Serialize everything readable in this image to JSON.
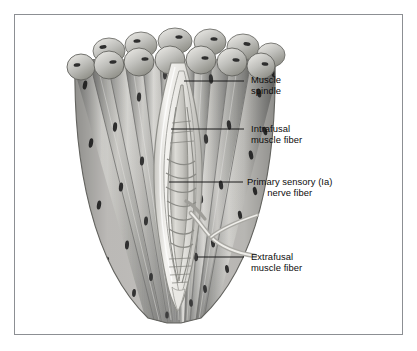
{
  "figure": {
    "kind": "anatomical-illustration",
    "style": "grayscale airbrush illustration",
    "frame_border_color": "#8c8f93",
    "background_color": "#ffffff"
  },
  "labels": [
    {
      "id": "muscle-spindle",
      "line1": "Muscle",
      "line2": "spindle",
      "align": "left",
      "text_x": 236,
      "text_y": 59,
      "leader": {
        "x1": 169,
        "x2": 229,
        "y": 66
      }
    },
    {
      "id": "intrafusal-muscle-fiber",
      "line1": "Intrafusal",
      "line2": "muscle fiber",
      "align": "left",
      "text_x": 236,
      "text_y": 108,
      "leader": {
        "x1": 156,
        "x2": 229,
        "y": 114
      }
    },
    {
      "id": "primary-sensory-nerve-fiber",
      "line1": "Primary sensory (Ia)",
      "line2": "nerve fiber",
      "align": "center",
      "text_x": 232,
      "text_y": 161,
      "leader": {
        "x1": 154,
        "x2": 228,
        "y": 167
      }
    },
    {
      "id": "extrafusal-muscle-fiber",
      "line1": "Extrafusal",
      "line2": "muscle fiber",
      "align": "left",
      "text_x": 236,
      "text_y": 236,
      "leader": {
        "x1": 182,
        "x2": 229,
        "y": 242
      }
    }
  ],
  "palette": {
    "fiber_light": "#e4e4e2",
    "fiber_mid": "#b4b4b2",
    "fiber_dark": "#8a8a88",
    "fiber_edge": "#6d6d6b",
    "nucleus": "#2e2e2e",
    "capsule_light": "#f2f1ee",
    "capsule_edge": "#9a9a96",
    "intrafusal": "#c9c7c2",
    "nerve": "#9e9d99",
    "leader_line": "#1b1b1b"
  },
  "structures": {
    "extrafusal_fiber_count": 11,
    "cap_row_count": 2,
    "bundle_top_y": 16,
    "bundle_tip_y": 308,
    "spindle_top_y": 56,
    "spindle_bottom_y": 272,
    "nerve_branch": "Ia afferent exits bundle toward lower right"
  }
}
